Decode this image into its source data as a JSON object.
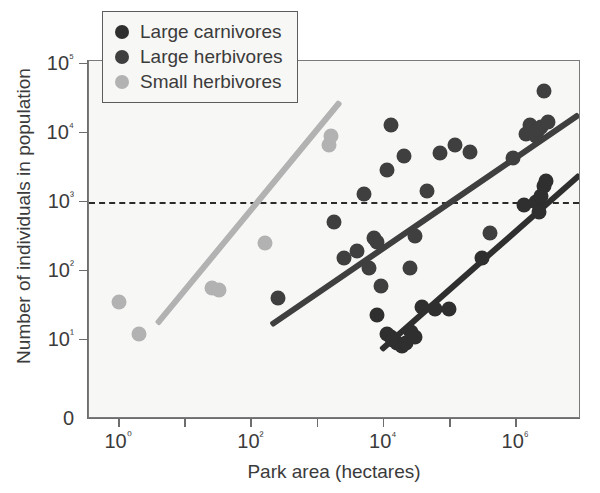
{
  "chart_data": {
    "type": "scatter",
    "title": "",
    "xlabel": "Park area (hectares)",
    "ylabel": "Number of individuals in population",
    "xscale": "log",
    "yscale": "log",
    "xlim": [
      0.3,
      12000000
    ],
    "ylim": [
      5,
      100000
    ],
    "grid": false,
    "legend_position": "top-left",
    "x_tick_labels": [
      "10⁰",
      "10²",
      "10⁴",
      "10⁶"
    ],
    "x_tick_values": [
      1,
      100,
      10000,
      1000000
    ],
    "x_minor_tick_values": [
      10,
      1000,
      100000
    ],
    "y_tick_labels": [
      "10⁵",
      "10⁴",
      "10³",
      "10²",
      "10¹",
      "0"
    ],
    "y_tick_values": [
      100000,
      10000,
      1000,
      100,
      10,
      0
    ],
    "annotations": [
      {
        "name": "minimum-viable-population-line",
        "type": "horizontal-reference-line",
        "y": 1000,
        "style": "dashed",
        "color": "#2b2b2b"
      }
    ],
    "series": [
      {
        "name": "Large carnivores",
        "color": "#2f2f2f",
        "marker": "circle",
        "points": [
          {
            "x": 8000,
            "y": 23
          },
          {
            "x": 11000,
            "y": 12
          },
          {
            "x": 13000,
            "y": 11
          },
          {
            "x": 14000,
            "y": 10
          },
          {
            "x": 16000,
            "y": 9
          },
          {
            "x": 19000,
            "y": 8
          },
          {
            "x": 22000,
            "y": 9
          },
          {
            "x": 26000,
            "y": 13
          },
          {
            "x": 30000,
            "y": 11
          },
          {
            "x": 38000,
            "y": 30
          },
          {
            "x": 60000,
            "y": 28
          },
          {
            "x": 95000,
            "y": 28
          },
          {
            "x": 300000,
            "y": 150
          },
          {
            "x": 1300000,
            "y": 900
          },
          {
            "x": 2000000,
            "y": 1000
          },
          {
            "x": 2200000,
            "y": 700
          },
          {
            "x": 2400000,
            "y": 1200
          },
          {
            "x": 2600000,
            "y": 1700
          },
          {
            "x": 2800000,
            "y": 2000
          }
        ],
        "fit_line": {
          "x1": 9000,
          "y1": 7,
          "x2": 9000000,
          "y2": 2400
        }
      },
      {
        "name": "Large herbivores",
        "color": "#3f3f3f",
        "marker": "circle",
        "points": [
          {
            "x": 250,
            "y": 40
          },
          {
            "x": 1800,
            "y": 500
          },
          {
            "x": 2500,
            "y": 150
          },
          {
            "x": 4000,
            "y": 190
          },
          {
            "x": 5000,
            "y": 1300
          },
          {
            "x": 6000,
            "y": 110
          },
          {
            "x": 7000,
            "y": 300
          },
          {
            "x": 8000,
            "y": 260
          },
          {
            "x": 9000,
            "y": 60
          },
          {
            "x": 11000,
            "y": 2900
          },
          {
            "x": 13000,
            "y": 13000
          },
          {
            "x": 20000,
            "y": 4500
          },
          {
            "x": 25000,
            "y": 110
          },
          {
            "x": 30000,
            "y": 320
          },
          {
            "x": 45000,
            "y": 1400
          },
          {
            "x": 70000,
            "y": 5000
          },
          {
            "x": 120000,
            "y": 6500
          },
          {
            "x": 200000,
            "y": 5200
          },
          {
            "x": 400000,
            "y": 350
          },
          {
            "x": 900000,
            "y": 4200
          },
          {
            "x": 1400000,
            "y": 9500
          },
          {
            "x": 1600000,
            "y": 13000
          },
          {
            "x": 2000000,
            "y": 9000
          },
          {
            "x": 2100000,
            "y": 11000
          },
          {
            "x": 2400000,
            "y": 12000
          },
          {
            "x": 2600000,
            "y": 40000
          },
          {
            "x": 3000000,
            "y": 14000
          }
        ],
        "fit_line": {
          "x1": 200,
          "y1": 16,
          "x2": 9000000,
          "y2": 18000
        }
      },
      {
        "name": "Small herbivores",
        "color": "#b2b2b2",
        "marker": "circle",
        "points": [
          {
            "x": 1,
            "y": 35
          },
          {
            "x": 2,
            "y": 12
          },
          {
            "x": 25,
            "y": 55
          },
          {
            "x": 32,
            "y": 52
          },
          {
            "x": 160,
            "y": 250
          },
          {
            "x": 1500,
            "y": 6500
          },
          {
            "x": 1600,
            "y": 9000
          }
        ],
        "fit_line": {
          "x1": 3.8,
          "y1": 17,
          "x2": 2200,
          "y2": 28000
        }
      }
    ]
  },
  "legend": {
    "items": [
      {
        "label": "Large carnivores",
        "color": "#2f2f2f"
      },
      {
        "label": "Large herbivores",
        "color": "#3f3f3f"
      },
      {
        "label": "Small herbivores",
        "color": "#b2b2b2"
      }
    ]
  }
}
